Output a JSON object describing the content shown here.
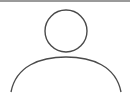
{
  "avatar": {
    "icon": "user-placeholder-icon",
    "label": "User avatar",
    "stroke_color": "#4a4a4a",
    "top_rule_color": "#9a9a9a"
  }
}
